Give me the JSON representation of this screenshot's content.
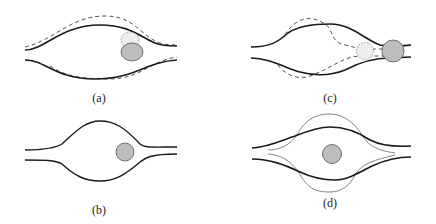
{
  "figure": {
    "panels": [
      {
        "id": "a",
        "label": "(a)",
        "description": "Channel with dashed displaced wall outline; particle (grey ellipse) with dotted previous position near right constriction"
      },
      {
        "id": "b",
        "label": "(b)",
        "description": "Bulged channel with grey particle near right exit"
      },
      {
        "id": "c",
        "label": "(c)",
        "description": "Channel with dashed wave-like wall outline; dotted previous particle position and grey particle at right exit"
      },
      {
        "id": "d",
        "label": "(d)",
        "description": "Channel with thick walls and thin oscillating wall outline; grey particle centered"
      }
    ],
    "colors": {
      "wall": "#1a1a1a",
      "dashed": "#555555",
      "thin": "#666666",
      "particle_fill": "#bdbdbd",
      "particle_stroke": "#555555",
      "dotted_fill": "#e6e6e6"
    }
  }
}
